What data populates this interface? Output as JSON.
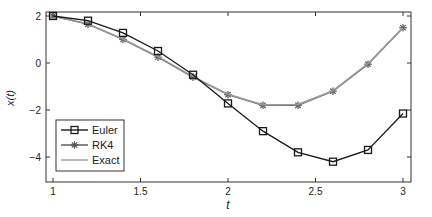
{
  "chart_data": {
    "type": "line",
    "title": "",
    "xlabel": "t",
    "ylabel": "x(t)",
    "xlim": [
      0.96,
      3.05
    ],
    "ylim": [
      -5.1,
      2.15
    ],
    "xticks": [
      1,
      1.5,
      2,
      2.5,
      3
    ],
    "xtick_labels": [
      "1",
      "1.5",
      "2",
      "2.5",
      "3"
    ],
    "yticks": [
      2,
      0,
      -2,
      -4
    ],
    "ytick_labels": [
      "2",
      "0",
      "−2",
      "−4"
    ],
    "grid": false,
    "legend_position": "lower left",
    "x": [
      1.0,
      1.2,
      1.4,
      1.6,
      1.8,
      2.0,
      2.2,
      2.4,
      2.6,
      2.8,
      3.0
    ],
    "series": [
      {
        "name": "Euler",
        "marker": "square",
        "color": "#1a1a1a",
        "values": [
          2.0,
          1.8,
          1.28,
          0.51,
          -0.5,
          -1.72,
          -2.9,
          -3.8,
          -4.2,
          -3.7,
          -2.15
        ]
      },
      {
        "name": "RK4",
        "marker": "asterisk",
        "color": "#555555",
        "values": [
          2.0,
          1.65,
          1.0,
          0.25,
          -0.6,
          -1.35,
          -1.8,
          -1.8,
          -1.2,
          -0.05,
          1.5
        ]
      },
      {
        "name": "Exact",
        "marker": "none",
        "color": "#9a9a9a",
        "values": [
          2.0,
          1.66,
          1.02,
          0.27,
          -0.58,
          -1.33,
          -1.78,
          -1.77,
          -1.18,
          -0.03,
          1.5
        ]
      }
    ]
  }
}
